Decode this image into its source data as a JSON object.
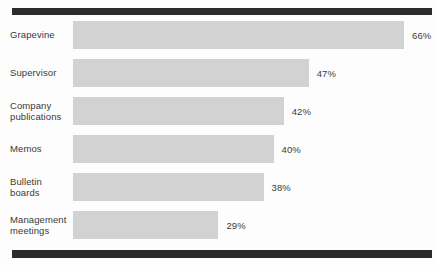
{
  "chart_data": {
    "type": "bar",
    "orientation": "horizontal",
    "title": "",
    "subtitle": "",
    "xlabel": "",
    "ylabel": "",
    "grid": false,
    "legend": null,
    "axis_visible": false,
    "tick_labels": [],
    "xlim": [
      0,
      66
    ],
    "value_suffix": "%",
    "categories": [
      "Grapevine",
      "Supervisor",
      "Company\npublications",
      "Memos",
      "Bulletin\nboards",
      "Management\nmeetings"
    ],
    "values": [
      66,
      47,
      42,
      40,
      38,
      29
    ],
    "value_labels": [
      "66%",
      "47%",
      "42%",
      "40%",
      "38%",
      "29%"
    ],
    "colors": {
      "bar_fill": "#d2d2d2",
      "rule": "#2b2b2b",
      "text": "#3a3a3a",
      "background": "#fdfdfd"
    }
  }
}
